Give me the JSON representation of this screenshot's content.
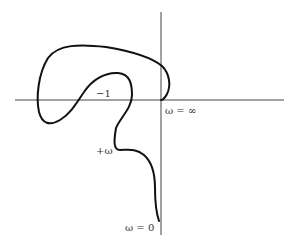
{
  "diagram": {
    "type": "nyquist-plot",
    "colors": {
      "axis": "#444444",
      "curve": "#111111",
      "text": "#333333"
    },
    "labels": {
      "critical_point": "−1",
      "omega_infinity": "ω = ∞",
      "omega_direction": "+ω",
      "omega_zero": "ω = 0"
    }
  }
}
